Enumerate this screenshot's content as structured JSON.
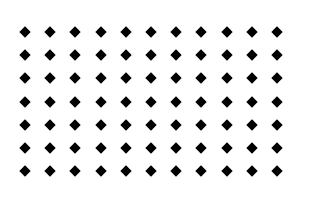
{
  "grid": {
    "rows": 7,
    "cols": 11,
    "origin_x": 25,
    "origin_y": 32,
    "step_x": 25.2,
    "step_y": 23.2,
    "shape": "diamond",
    "color": "#000000",
    "background": "#ffffff"
  }
}
